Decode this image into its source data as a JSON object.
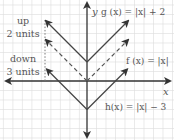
{
  "figure": {
    "grid_unit_px": 9.5,
    "origin_px": {
      "x": 87,
      "y": 81
    },
    "axes": {
      "x_label": "x",
      "y_label": "y"
    },
    "functions": [
      {
        "id": "g",
        "label": "g (x) = |x| + 2",
        "style": "solid",
        "vertex": [
          0,
          2
        ]
      },
      {
        "id": "f",
        "label": "f (x) = |x|",
        "style": "dashed",
        "vertex": [
          0,
          0
        ]
      },
      {
        "id": "h",
        "label": "h(x) = |x| − 3",
        "style": "solid",
        "vertex": [
          0,
          -3
        ]
      }
    ],
    "annotations": {
      "up_line1": "up",
      "up_line2": "2 units",
      "down_line1": "down",
      "down_line2": "3 units"
    },
    "colors": {
      "grid": "#dcdcdc",
      "axis": "#333333",
      "curve": "#444444",
      "text": "#555555",
      "dotted_guide": "#777777"
    }
  }
}
